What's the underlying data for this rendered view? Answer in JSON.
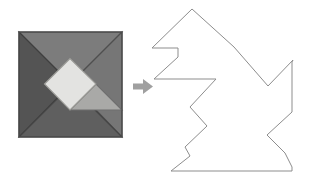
{
  "figure": {
    "kind": "tangram-puzzle-illustration",
    "canvas": {
      "width": 312,
      "height": 177,
      "background": "#ffffff"
    },
    "caption": "",
    "source_square": {
      "label": "tangram-square",
      "bounds": {
        "x": 19,
        "y": 32,
        "width": 103,
        "height": 105
      },
      "border_color": "#4a4a4a",
      "pieces": [
        {
          "name": "large-triangle-upper",
          "shape": "triangle",
          "color": "#7c7c7c",
          "points": "19,32 122,32 70.5,83.5"
        },
        {
          "name": "large-triangle-right",
          "shape": "triangle",
          "color": "#767676",
          "points": "122,32 122,137 70.5,83.5"
        },
        {
          "name": "large-triangle-left",
          "shape": "triangle",
          "color": "#545454",
          "points": "19,32 19,137 71,84"
        },
        {
          "name": "bottom-strip-triangle",
          "shape": "triangle",
          "color": "#5f5f5f",
          "points": "19,137 122,137 70.5,85.5"
        },
        {
          "name": "square-piece",
          "shape": "square",
          "color": "#e3e3e1",
          "points": "44.5,84 70,58.5 96,84 70,110"
        },
        {
          "name": "medium-triangle",
          "shape": "triangle",
          "color": "#a9a9a7",
          "points": "70,110 96,84 122,110"
        },
        {
          "name": "small-triangle-lower",
          "shape": "triangle",
          "color": "#999997",
          "points": "70,110 122,110 96,110"
        }
      ]
    },
    "arrow": {
      "name": "right-arrow",
      "color": "#a0a0a0",
      "bounds": {
        "x": 133,
        "y": 79,
        "width": 20,
        "height": 15
      }
    },
    "result_outline": {
      "name": "assembled-silhouette",
      "stroke": "#8d8d8d",
      "stroke_width": 1,
      "fill": "none",
      "points": "192,9 152,48 178,48 178,57 154,79 216,79 190,107 207,126 185,147 190,156 171,171 292,171 292,167 285,153 267,135 292,112 292,62 293,60 268,86 234,47"
    }
  }
}
